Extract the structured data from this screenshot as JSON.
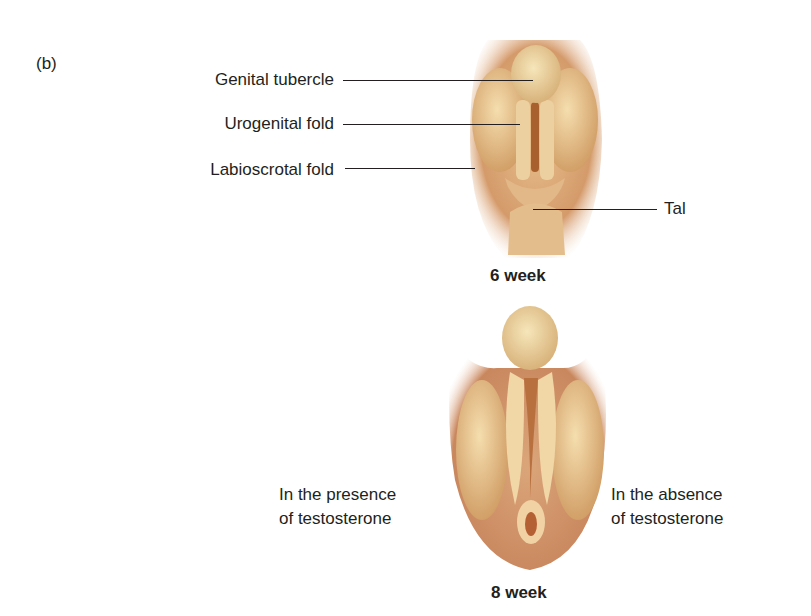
{
  "panel_label": "(b)",
  "stage_6_week": {
    "caption": "6 week",
    "labels": {
      "genital_tubercle": "Genital tubercle",
      "urogenital_fold": "Urogenital fold",
      "labioscrotal_fold": "Labioscrotal fold",
      "tail": "Tal"
    }
  },
  "stage_8_week": {
    "caption": "8 week",
    "left_note_line1": "In the presence",
    "left_note_line2": "of testosterone",
    "right_note_line1": "In the absence",
    "right_note_line2": "of testosterone"
  },
  "colors": {
    "skin_dark": "#c98a5e",
    "skin_mid": "#deb07e",
    "skin_light": "#f1d6a6",
    "tubercle": "#efd9a4",
    "groove": "#a9602f",
    "text": "#231f20"
  }
}
